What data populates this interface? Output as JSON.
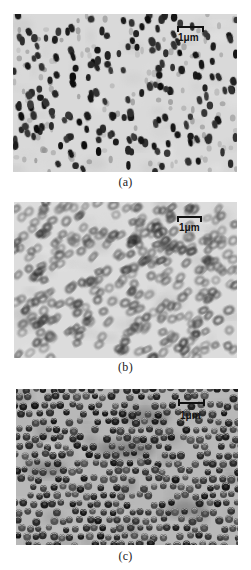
{
  "figure": {
    "panels": [
      {
        "id": "a",
        "caption": "(a)",
        "scale_bar_label": "1μm",
        "description": "discrete dark elliptical particles on light background",
        "background_color": "#d9d9d9",
        "particle_color": "#1e1e1e"
      },
      {
        "id": "b",
        "caption": "(b)",
        "scale_bar_label": "1μm",
        "description": "dense ring-shaped tilted particles",
        "background_color": "#dcdcdc",
        "particle_color": "#2a2a2a"
      },
      {
        "id": "c",
        "caption": "(c)",
        "scale_bar_label": "1μm",
        "description": "densely packed round cup-shaped particles",
        "background_color": "#b8b8b8",
        "particle_color": "#262626"
      }
    ]
  }
}
